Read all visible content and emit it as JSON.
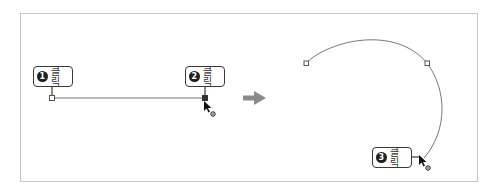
{
  "diagram": {
    "colors": {
      "frame_border": "#c8c8c8",
      "line": "#777777",
      "label_border": "#3a3a3a",
      "badge": "#222222",
      "arrow": "#8a8a8a"
    },
    "steps": [
      {
        "number": "1",
        "label": "클릭"
      },
      {
        "number": "2",
        "label": "클릭"
      },
      {
        "number": "3",
        "label": "클릭"
      }
    ],
    "transition_arrow": "right-arrow"
  }
}
